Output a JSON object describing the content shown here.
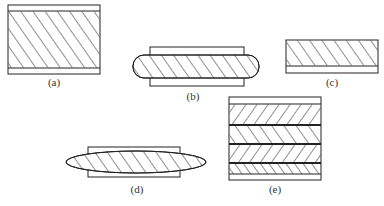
{
  "figure": {
    "panels": [
      {
        "id": "a",
        "label": "(a)",
        "hatch": "backslash"
      },
      {
        "id": "b",
        "label": "(b)",
        "hatch": "backslash"
      },
      {
        "id": "c",
        "label": "(c)",
        "hatch": "backslash"
      },
      {
        "id": "d",
        "label": "(d)",
        "hatch": "backslash"
      },
      {
        "id": "e",
        "label": "(e)",
        "hatch": "alternating-layers"
      }
    ],
    "colors": {
      "line": "#222222",
      "background": "#ffffff"
    }
  }
}
